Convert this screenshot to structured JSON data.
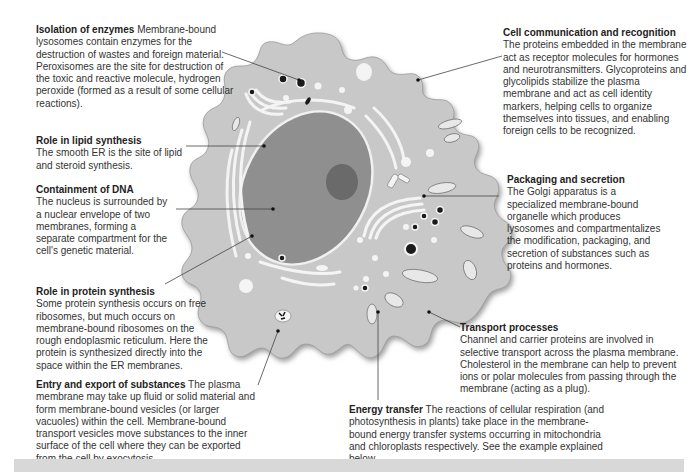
{
  "diagram": {
    "colors": {
      "cytoplasm": "#c8c8c8",
      "cell_outline_shadow": "#8a8a8a",
      "nucleus": "#8f8f8f",
      "nucleolus": "#6a6a6a",
      "organelle_white": "#f4f4f4",
      "dark_vesicle": "#1a1a1a",
      "leader_line": "#444444",
      "footer_bar": "#d8d8d8"
    },
    "labels": [
      {
        "id": "isolation-of-enzymes",
        "heading": "Isolation of enzymes",
        "body": " Membrane-bound lysosomes contain enzymes for the destruction of wastes and foreign material. Peroxisomes are the site for destruction of the toxic and reactive molecule, hydrogen peroxide (formed as a result of some cellular reactions).",
        "heading_inline": true
      },
      {
        "id": "role-in-lipid-synthesis",
        "heading": "Role in lipid synthesis",
        "body": "The smooth ER is the site of lipid and steroid synthesis.",
        "heading_inline": false
      },
      {
        "id": "containment-of-dna",
        "heading": "Containment of DNA",
        "body": "The nucleus is surrounded by a nuclear envelope of two membranes, forming a separate compartment for the cell's genetic material.",
        "heading_inline": false
      },
      {
        "id": "role-in-protein-synthesis",
        "heading": "Role in protein synthesis",
        "body": "Some protein synthesis occurs on free ribosomes, but much occurs on membrane-bound ribosomes on the rough endoplasmic reticulum. Here the protein is synthesized directly into the space within the ER membranes.",
        "heading_inline": false
      },
      {
        "id": "entry-and-export-of-substances",
        "heading": "Entry and export of substances",
        "body": " The plasma membrane may take up fluid or solid material and form membrane-bound vesicles (or larger vacuoles) within the cell. Membrane-bound transport vesicles move substances to the inner surface of the cell where they can be exported from the cell by exocytosis.",
        "heading_inline": true
      },
      {
        "id": "cell-communication-and-recognition",
        "heading": "Cell communication and recognition",
        "body": "The proteins embedded in the membrane act as receptor molecules for hormones and neurotransmitters. Glycoproteins and glycolipids stabilize the plasma membrane and act as cell identity markers, helping cells to organize themselves into tissues, and enabling foreign cells to be recognized.",
        "heading_inline": false
      },
      {
        "id": "packaging-and-secretion",
        "heading": "Packaging and secretion",
        "body": "The Golgi apparatus is a specialized membrane-bound organelle which produces lysosomes and compartmentalizes the modification, packaging, and secretion of substances such as proteins and hormones.",
        "heading_inline": false
      },
      {
        "id": "transport-processes",
        "heading": "Transport processes",
        "body": "Channel and carrier proteins are involved in selective transport across the plasma membrane. Cholesterol in the membrane can help to prevent ions or polar molecules from passing through the membrane (acting as a plug).",
        "heading_inline": false
      },
      {
        "id": "energy-transfer",
        "heading": "Energy transfer",
        "body": " The reactions of cellular respiration (and photosynthesis in plants) take place in the membrane-bound energy transfer systems occurring in mitochondria and chloroplasts respectively. See the example explained below.",
        "heading_inline": true
      }
    ]
  }
}
